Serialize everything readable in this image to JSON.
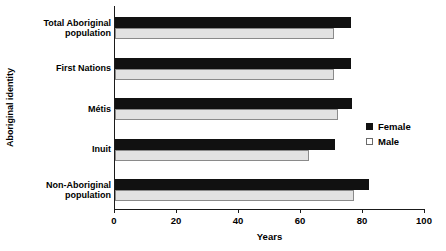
{
  "chart_data": {
    "type": "bar",
    "orientation": "horizontal",
    "title": "",
    "xlabel": "Years",
    "ylabel": "Aboriginal identity",
    "xlim": [
      0,
      100
    ],
    "xticks": [
      0,
      20,
      40,
      60,
      80,
      100
    ],
    "xtick_labels": [
      "0",
      "20",
      "40",
      "60",
      "80",
      "100"
    ],
    "grid": false,
    "legend_position": "right",
    "categories": [
      "Total Aboriginal population",
      "First Nations",
      "Métis",
      "Inuit",
      "Non-Aboriginal population"
    ],
    "category_lines": [
      [
        "Total Aboriginal",
        "population"
      ],
      [
        "First Nations"
      ],
      [
        "Métis"
      ],
      [
        "Inuit"
      ],
      [
        "Non-Aboriginal",
        "population"
      ]
    ],
    "series": [
      {
        "name": "Female",
        "color": "#111111",
        "values": [
          76.0,
          76.0,
          76.5,
          71.0,
          82.0
        ]
      },
      {
        "name": "Male",
        "color": "#e2e2e2",
        "values": [
          70.5,
          70.5,
          72.0,
          62.5,
          77.0
        ]
      }
    ]
  },
  "legend": {
    "items": [
      {
        "label": "Female",
        "swatch": "filled-square-icon"
      },
      {
        "label": "Male",
        "swatch": "outlined-square-icon"
      }
    ]
  },
  "axes": {
    "x_title": "Years",
    "y_title": "Aboriginal identity"
  }
}
